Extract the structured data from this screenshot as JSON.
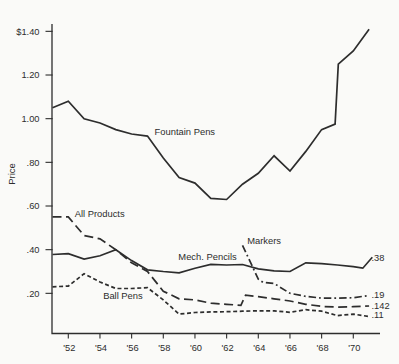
{
  "figure": {
    "ink_color": "#2d2d2d",
    "background_color": "#fafaf8"
  },
  "chart_data": {
    "type": "line",
    "title": "",
    "xlabel": "",
    "ylabel": "Price",
    "grid": false,
    "legend": "inline-labels",
    "x_range": [
      1951,
      1971.6
    ],
    "ylim": [
      0,
      1.45
    ],
    "y_ticks": [
      {
        "label": "$1.40",
        "value": 1.4
      },
      {
        "label": "1.20",
        "value": 1.2
      },
      {
        "label": "1.00",
        "value": 1.0
      },
      {
        "label": ".80",
        "value": 0.8
      },
      {
        "label": ".60",
        "value": 0.6
      },
      {
        "label": ".40",
        "value": 0.4
      },
      {
        "label": ".20",
        "value": 0.2
      }
    ],
    "x_ticks": [
      {
        "label": "'52",
        "year": 1952
      },
      {
        "label": "'54",
        "year": 1954
      },
      {
        "label": "'56",
        "year": 1956
      },
      {
        "label": "'58",
        "year": 1958
      },
      {
        "label": "'60",
        "year": 1960
      },
      {
        "label": "'62",
        "year": 1962
      },
      {
        "label": "'64",
        "year": 1964
      },
      {
        "label": "'66",
        "year": 1966
      },
      {
        "label": "'68",
        "year": 1968
      },
      {
        "label": "'70",
        "year": 1970
      }
    ],
    "series": [
      {
        "name": "Fountain Pens",
        "line_style": "solid",
        "points": [
          [
            1951,
            1.05
          ],
          [
            1952,
            1.08
          ],
          [
            1953,
            1.0
          ],
          [
            1954,
            0.98
          ],
          [
            1955,
            0.95
          ],
          [
            1956,
            0.93
          ],
          [
            1957,
            0.92
          ],
          [
            1958,
            0.82
          ],
          [
            1959,
            0.73
          ],
          [
            1960,
            0.705
          ],
          [
            1961,
            0.635
          ],
          [
            1962,
            0.63
          ],
          [
            1963,
            0.7
          ],
          [
            1964,
            0.75
          ],
          [
            1965,
            0.83
          ],
          [
            1966,
            0.76
          ],
          [
            1967,
            0.85
          ],
          [
            1968,
            0.95
          ],
          [
            1968.85,
            0.975
          ],
          [
            1969.05,
            1.25
          ],
          [
            1970,
            1.31
          ],
          [
            1971,
            1.41
          ]
        ]
      },
      {
        "name": "All Products",
        "line_style": "long-dash",
        "points": [
          [
            1951,
            0.55
          ],
          [
            1952,
            0.55
          ],
          [
            1953,
            0.465
          ],
          [
            1954,
            0.45
          ],
          [
            1955,
            0.4
          ],
          [
            1956,
            0.34
          ],
          [
            1957,
            0.3
          ],
          [
            1958,
            0.21
          ],
          [
            1959,
            0.175
          ],
          [
            1960,
            0.17
          ],
          [
            1961,
            0.155
          ],
          [
            1962,
            0.15
          ],
          [
            1962.9,
            0.145
          ],
          [
            1963.2,
            0.192
          ],
          [
            1964,
            0.185
          ],
          [
            1965,
            0.175
          ],
          [
            1966,
            0.165
          ],
          [
            1967,
            0.15
          ],
          [
            1968,
            0.14
          ],
          [
            1969,
            0.137
          ],
          [
            1970,
            0.139
          ],
          [
            1971,
            0.142
          ]
        ]
      },
      {
        "name": "Mech. Pencils",
        "line_style": "solid",
        "points": [
          [
            1951,
            0.378
          ],
          [
            1952,
            0.382
          ],
          [
            1953,
            0.357
          ],
          [
            1954,
            0.372
          ],
          [
            1955,
            0.4
          ],
          [
            1956,
            0.35
          ],
          [
            1957,
            0.308
          ],
          [
            1958,
            0.3
          ],
          [
            1959,
            0.294
          ],
          [
            1960,
            0.315
          ],
          [
            1961,
            0.333
          ],
          [
            1962,
            0.33
          ],
          [
            1963,
            0.332
          ],
          [
            1964,
            0.312
          ],
          [
            1965,
            0.303
          ],
          [
            1966,
            0.3
          ],
          [
            1967,
            0.34
          ],
          [
            1968,
            0.336
          ],
          [
            1969,
            0.33
          ],
          [
            1970,
            0.322
          ],
          [
            1970.6,
            0.315
          ],
          [
            1971.2,
            0.365
          ]
        ]
      },
      {
        "name": "Ball Pens",
        "line_style": "short-dash",
        "points": [
          [
            1951,
            0.23
          ],
          [
            1952,
            0.233
          ],
          [
            1953,
            0.29
          ],
          [
            1954,
            0.252
          ],
          [
            1955,
            0.222
          ],
          [
            1956,
            0.222
          ],
          [
            1957,
            0.226
          ],
          [
            1958,
            0.17
          ],
          [
            1959,
            0.105
          ],
          [
            1960,
            0.112
          ],
          [
            1961,
            0.115
          ],
          [
            1962,
            0.116
          ],
          [
            1963,
            0.118
          ],
          [
            1964,
            0.12
          ],
          [
            1965,
            0.12
          ],
          [
            1966,
            0.113
          ],
          [
            1967,
            0.125
          ],
          [
            1968,
            0.118
          ],
          [
            1969,
            0.098
          ],
          [
            1970,
            0.105
          ],
          [
            1971,
            0.094
          ]
        ]
      },
      {
        "name": "Markers",
        "line_style": "dash-dot",
        "points": [
          [
            1963,
            0.42
          ],
          [
            1964,
            0.265
          ],
          [
            1964.3,
            0.25
          ],
          [
            1965,
            0.245
          ],
          [
            1966,
            0.2
          ],
          [
            1967,
            0.186
          ],
          [
            1968,
            0.178
          ],
          [
            1969,
            0.178
          ],
          [
            1970,
            0.18
          ],
          [
            1971,
            0.19
          ]
        ]
      }
    ],
    "series_labels": [
      {
        "text": "Fountain Pens",
        "year": 1957.45,
        "value": 0.94
      },
      {
        "text": "All Products",
        "year": 1952.4,
        "value": 0.565
      },
      {
        "text": "Mech. Pencils",
        "year": 1958.95,
        "value": 0.365
      },
      {
        "text": "Ball Pens",
        "year": 1954.2,
        "value": 0.19
      },
      {
        "text": "Markers",
        "year": 1963.3,
        "value": 0.44
      }
    ],
    "end_value_labels": [
      {
        "text": ".38",
        "series": "Mech. Pencils",
        "value": 0.364
      },
      {
        "text": ".19",
        "series": "Markers",
        "value": 0.192
      },
      {
        "text": ".142",
        "series": "All Products",
        "value": 0.142
      },
      {
        "text": ".11",
        "series": "Ball Pens",
        "value": 0.1
      }
    ]
  }
}
